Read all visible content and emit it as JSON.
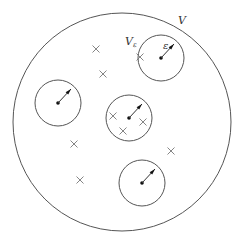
{
  "diagram": {
    "outer_region": {
      "label": "V",
      "cx": 122,
      "cy": 122,
      "r": 109
    },
    "inner_regions": [
      {
        "cx": 161,
        "cy": 58,
        "r": 23,
        "ax": 174,
        "ay": 44
      },
      {
        "cx": 58,
        "cy": 103,
        "r": 23,
        "ax": 71,
        "ay": 89
      },
      {
        "cx": 129,
        "cy": 118,
        "r": 23,
        "ax": 142,
        "ay": 104
      },
      {
        "cx": 142,
        "cy": 183,
        "r": 23,
        "ax": 155,
        "ay": 169
      }
    ],
    "crosses": [
      [
        96,
        49
      ],
      [
        103,
        74
      ],
      [
        140,
        57
      ],
      [
        113,
        116
      ],
      [
        143,
        122
      ],
      [
        123,
        131
      ],
      [
        74,
        144
      ],
      [
        171,
        151
      ],
      [
        80,
        180
      ]
    ],
    "labels": {
      "outer": "V",
      "inner": "V",
      "inner_sub": "ε",
      "radius": "ε"
    },
    "colors": {
      "stroke": "#555555",
      "fill": "#111111"
    }
  }
}
